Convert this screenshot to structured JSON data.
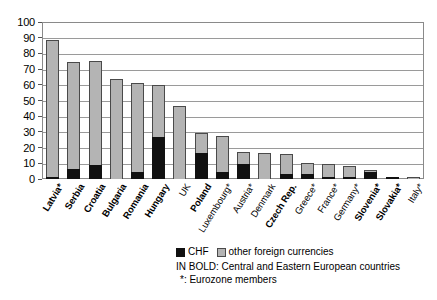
{
  "chart_data": {
    "type": "bar",
    "subtype": "stacked-vertical",
    "title": "",
    "xlabel": "",
    "ylabel": "",
    "ylim": [
      0,
      100
    ],
    "yticks": [
      0,
      10,
      20,
      30,
      40,
      50,
      60,
      70,
      80,
      90,
      100
    ],
    "grid": true,
    "legend_position": "bottom",
    "categories": [
      "Latvia*",
      "Serbia",
      "Croatia",
      "Bulgaria",
      "Romania",
      "Hungary",
      "UK",
      "Poland",
      "Luxembourg*",
      "Austria*",
      "Denmark",
      "Czech Rep.",
      "Greece*",
      "France*",
      "Germany*",
      "Slovenia*",
      "Slovakia*",
      "Italy*"
    ],
    "category_bold": [
      true,
      true,
      true,
      true,
      true,
      true,
      false,
      true,
      false,
      false,
      false,
      true,
      false,
      false,
      false,
      true,
      true,
      false
    ],
    "series": [
      {
        "name": "CHF",
        "color": "#111111",
        "values": [
          1,
          6.5,
          9,
          0,
          4.5,
          27,
          0,
          16.5,
          4.5,
          9.5,
          0,
          3,
          3,
          1,
          0.8,
          4.5,
          1.3,
          0
        ]
      },
      {
        "name": "other foreign currencies",
        "color": "#b4b4b4",
        "values": [
          87.5,
          68,
          66,
          63.5,
          56.5,
          33,
          46.5,
          13,
          23,
          8,
          16.3,
          13.2,
          7,
          8,
          7.2,
          0.3,
          0,
          1.3
        ]
      }
    ],
    "totals": [
      88.5,
      74.5,
      75,
      63.5,
      61,
      60,
      46.5,
      29.5,
      27.5,
      17.5,
      16.3,
      16.2,
      10,
      9,
      8,
      4.8,
      1.3,
      1.3
    ]
  },
  "legend": {
    "entries": [
      {
        "label": "CHF",
        "swatch": "chf"
      },
      {
        "label": "other foreign currencies",
        "swatch": "other"
      }
    ],
    "note_bold": "IN BOLD: Central and Eastern European countries",
    "note_star": "*: Eurozone members"
  }
}
